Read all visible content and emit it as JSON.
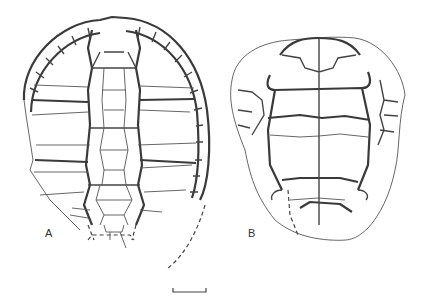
{
  "figure": {
    "panels": [
      {
        "id": "A",
        "label": "A",
        "description": "Carapace outline with vertebral, pleural and marginal scutes"
      },
      {
        "id": "B",
        "label": "B",
        "description": "Plastron outline with midline suture and scute sulci"
      }
    ],
    "scale_bar": {
      "shown": true
    }
  },
  "colors": {
    "line": "#3a3a3a",
    "background": "#ffffff"
  }
}
